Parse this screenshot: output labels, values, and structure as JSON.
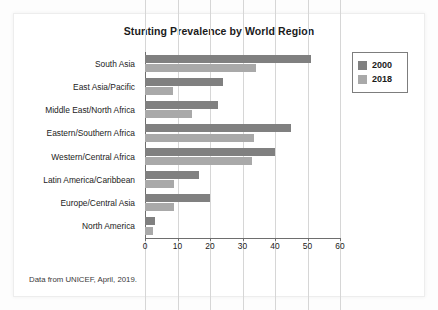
{
  "figure": {
    "title": "Stunting Prevalence by World Region",
    "footnote": "Data from UNICEF, April, 2019."
  },
  "legend": {
    "position": "right-top",
    "entries": [
      {
        "label": "2000",
        "color": "#808080"
      },
      {
        "label": "2018",
        "color": "#a9a9a9"
      }
    ]
  },
  "colors": {
    "series_2000": "#808080",
    "series_2018": "#a9a9a9",
    "gridline": "#d6d6d6",
    "axis": "#6e6e6e",
    "text": "#1b1b1b",
    "panel_background": "#ffffff",
    "page_background": "#fdfdfd"
  },
  "chart_data": {
    "type": "bar",
    "orientation": "horizontal",
    "title": "Stunting Prevalence by World Region",
    "subtitle": "",
    "xlabel": "",
    "ylabel": "",
    "xlim": [
      0,
      60
    ],
    "xticks": [
      0,
      10,
      20,
      30,
      40,
      50,
      60
    ],
    "xtick_labels": [
      "0",
      "10",
      "20",
      "30",
      "40",
      "50",
      "60"
    ],
    "grid": "vertical",
    "legend_position": "right-top",
    "annotations": [
      "Data from UNICEF, April, 2019."
    ],
    "categories": [
      "South Asia",
      "East Asia/Pacific",
      "Middle East/North Africa",
      "Eastern/Southern Africa",
      "Western/Central Africa",
      "Latin America/Caribbean",
      "Europe/Central Asia",
      "North America"
    ],
    "series": [
      {
        "name": "2000",
        "color": "#808080",
        "values": [
          51,
          24,
          22.5,
          45,
          40,
          16.5,
          20,
          3
        ]
      },
      {
        "name": "2018",
        "color": "#a9a9a9",
        "values": [
          34,
          8.5,
          14.5,
          33.5,
          33,
          9,
          9,
          2.5
        ]
      }
    ]
  }
}
